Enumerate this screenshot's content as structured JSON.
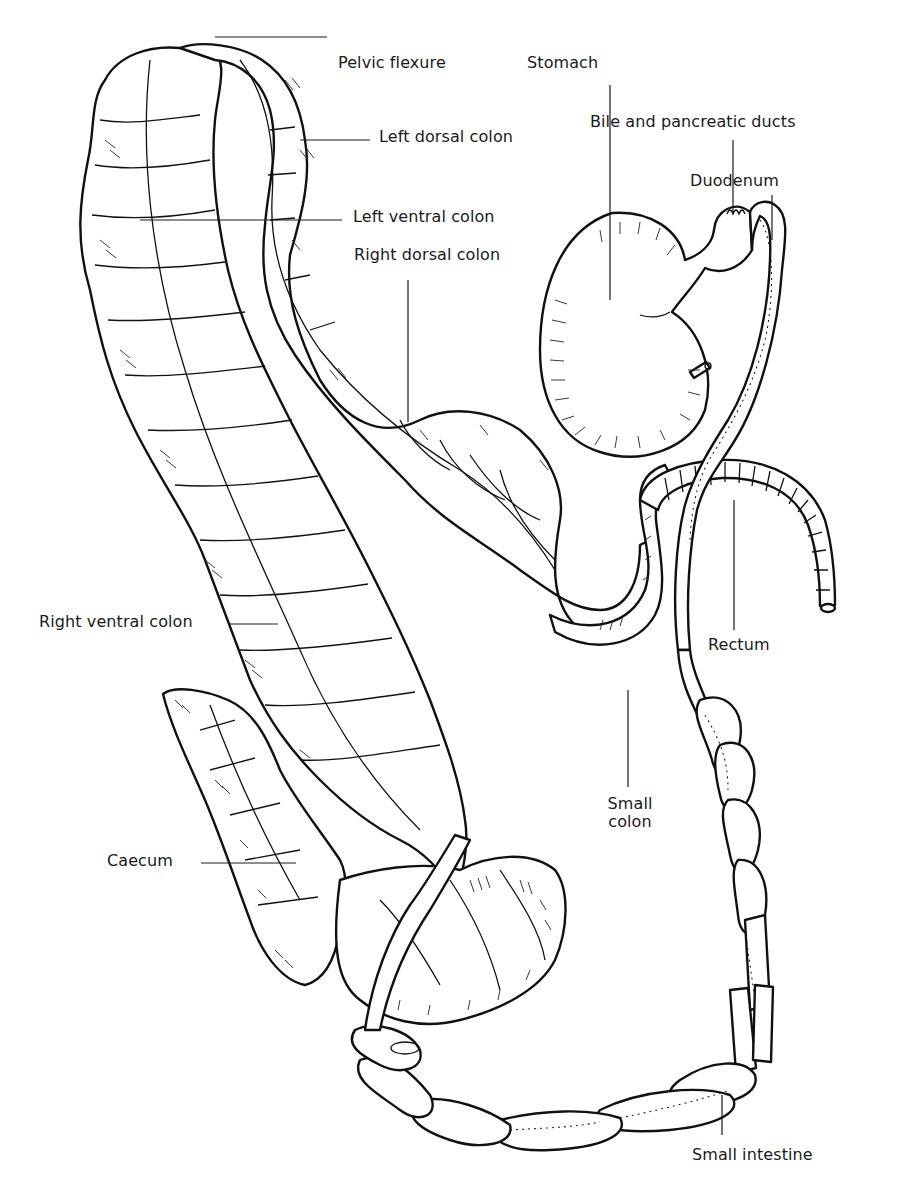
{
  "diagram": {
    "style": "black-and-white anatomical line illustration",
    "background": "#ffffff",
    "ink": "#111111",
    "labels": [
      {
        "id": "pelvic-flexure",
        "text": "Pelvic flexure"
      },
      {
        "id": "stomach",
        "text": "Stomach"
      },
      {
        "id": "left-dorsal-colon",
        "text": "Left dorsal colon"
      },
      {
        "id": "bile-pancreatic-ducts",
        "text": "Bile and pancreatic ducts"
      },
      {
        "id": "duodenum",
        "text": "Duodenum"
      },
      {
        "id": "left-ventral-colon",
        "text": "Left ventral colon"
      },
      {
        "id": "right-dorsal-colon",
        "text": "Right dorsal colon"
      },
      {
        "id": "right-ventral-colon",
        "text": "Right ventral colon"
      },
      {
        "id": "rectum",
        "text": "Rectum"
      },
      {
        "id": "small-colon",
        "text": "Small colon"
      },
      {
        "id": "caecum",
        "text": "Caecum"
      },
      {
        "id": "small-intestine",
        "text": "Small intestine"
      }
    ]
  }
}
